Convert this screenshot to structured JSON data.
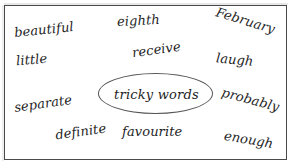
{
  "worksheet": {
    "center_label": "tricky words",
    "border_color": "#4a4a4a",
    "ellipse_color": "#555555",
    "text_color": "#1e1e1e",
    "background_color": "#ffffff",
    "words": [
      {
        "text": "beautiful",
        "x": 14,
        "y": 22,
        "rotation": -6,
        "size": 13
      },
      {
        "text": "eighth",
        "x": 117,
        "y": 13,
        "rotation": -3,
        "size": 13
      },
      {
        "text": "February",
        "x": 215,
        "y": 13,
        "rotation": 17,
        "size": 13
      },
      {
        "text": "little",
        "x": 16,
        "y": 52,
        "rotation": -5,
        "size": 13
      },
      {
        "text": "receive",
        "x": 132,
        "y": 42,
        "rotation": -8,
        "size": 13
      },
      {
        "text": "laugh",
        "x": 216,
        "y": 52,
        "rotation": 5,
        "size": 13
      },
      {
        "text": "separate",
        "x": 14,
        "y": 96,
        "rotation": -8,
        "size": 13
      },
      {
        "text": "probably",
        "x": 221,
        "y": 92,
        "rotation": 15,
        "size": 13
      },
      {
        "text": "definite",
        "x": 55,
        "y": 124,
        "rotation": -8,
        "size": 13
      },
      {
        "text": "favourite",
        "x": 122,
        "y": 124,
        "rotation": 0,
        "size": 13
      },
      {
        "text": "enough",
        "x": 224,
        "y": 132,
        "rotation": 10,
        "size": 13
      }
    ]
  }
}
